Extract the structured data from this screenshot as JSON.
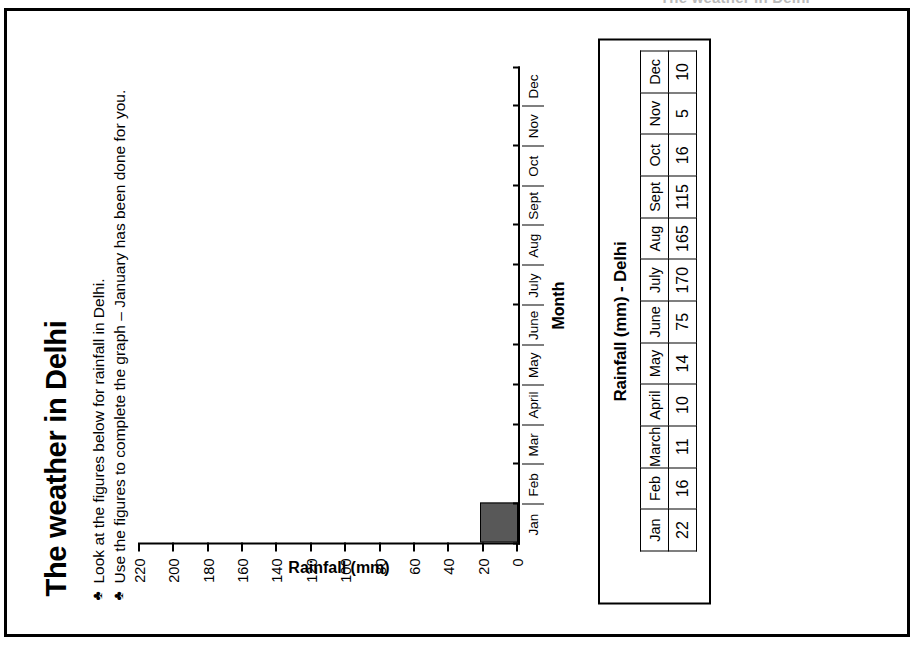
{
  "page": {
    "cut_off_header_sliver": "The weather in Delhi"
  },
  "worksheet": {
    "title": "The weather in Delhi",
    "bullet_glyph": "♣",
    "bullets": [
      "Look at the figures below for rainfall in Delhi.",
      "Use the figures to complete the graph – January has been done for you."
    ]
  },
  "table": {
    "title": "Rainfall (mm) - Delhi",
    "corner_label": "",
    "months": [
      "Jan",
      "Feb",
      "March",
      "April",
      "May",
      "June",
      "July",
      "Aug",
      "Sept",
      "Oct",
      "Nov",
      "Dec"
    ],
    "values": [
      "22",
      "16",
      "11",
      "10",
      "14",
      "75",
      "170",
      "165",
      "115",
      "16",
      "5",
      "10"
    ]
  },
  "chart_data": {
    "type": "bar",
    "title": "",
    "xlabel": "Month",
    "ylabel": "Rainfall (mm)",
    "categories": [
      "Jan",
      "Feb",
      "Mar",
      "April",
      "May",
      "June",
      "July",
      "Aug",
      "Sept",
      "Oct",
      "Nov",
      "Dec"
    ],
    "values": [
      22,
      null,
      null,
      null,
      null,
      null,
      null,
      null,
      null,
      null,
      null,
      null
    ],
    "ylim": [
      0,
      220
    ],
    "ytick_step": 20,
    "yticks": [
      "220",
      "200",
      "180",
      "160",
      "140",
      "120",
      "100",
      "80",
      "60",
      "40",
      "20",
      "0"
    ],
    "grid": false,
    "legend": false,
    "bar_fill": "#585858",
    "bar_stroke": "#000000",
    "note": "Only January is plotted; remaining bars are left blank for the pupil to complete."
  }
}
